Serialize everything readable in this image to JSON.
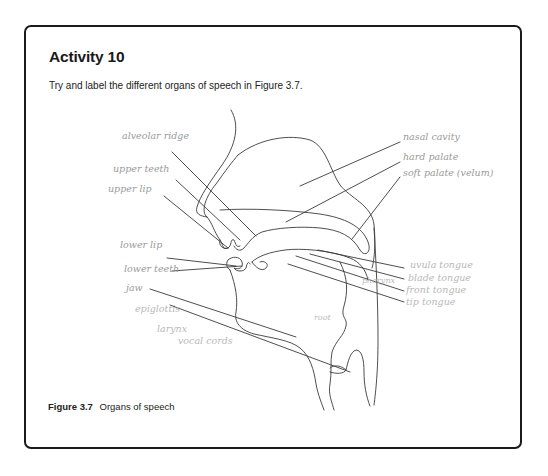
{
  "activity": {
    "title": "Activity 10",
    "instruction": "Try and label the different organs of speech in Figure 3.7."
  },
  "figure": {
    "label": "Figure 3.7",
    "caption": "Organs of speech",
    "handwritten_labels": {
      "left": [
        "alveolar ridge",
        "upper teeth",
        "upper lip",
        "lower lip",
        "lower teeth",
        "jaw",
        "epiglottis",
        "larynx",
        "vocal cords"
      ],
      "right": [
        "nasal cavity",
        "hard palate",
        "soft palate (velum)",
        "uvula tongue",
        "blade tongue",
        "front tongue",
        "tip tongue"
      ],
      "inner": [
        "pharynx",
        "root"
      ]
    }
  },
  "colors": {
    "border": "#1a1a1a",
    "ink": "#3a3a3a",
    "handwriting": "#9a9a9a",
    "background": "#ffffff"
  }
}
